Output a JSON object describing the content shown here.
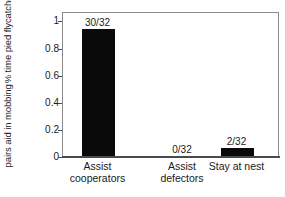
{
  "chart_data": {
    "type": "bar",
    "title": "",
    "xlabel": "",
    "ylabel_line1": "% time pied flycatcher",
    "ylabel_line2": "pairs aid in mobbing",
    "categories": [
      "Assist cooperators",
      "Assist defectors",
      "Stay at nest"
    ],
    "category_lines": [
      [
        "Assist",
        "cooperators"
      ],
      [
        "Assist",
        "defectors"
      ],
      [
        "Stay at nest"
      ]
    ],
    "values": [
      0.9375,
      0.0,
      0.0625
    ],
    "data_labels": [
      "30/32",
      "0/32",
      "2/32"
    ],
    "ylim": [
      0,
      1.07
    ],
    "yticks": [
      0,
      0.2,
      0.4,
      0.6,
      0.8,
      1
    ],
    "ytick_labels": [
      "0",
      "0.2",
      "0.4",
      "0.6",
      "0.8",
      "1"
    ],
    "grid": false,
    "legend": "none",
    "bar_color": "#0a0a0a",
    "frame_color": "#8a8a8a",
    "axis_color": "#4a4a4a",
    "background": "#ffffff"
  }
}
